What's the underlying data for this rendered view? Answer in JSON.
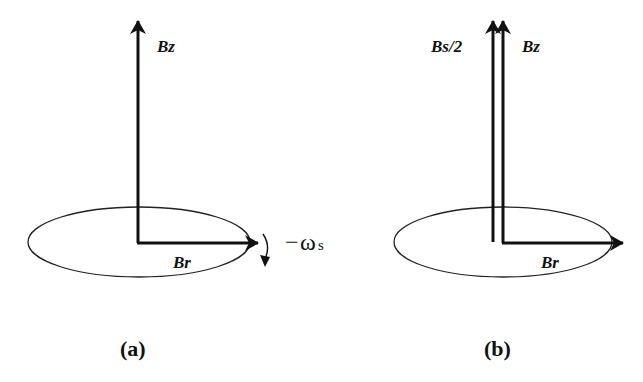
{
  "figure": {
    "panels": [
      {
        "id": "a",
        "caption": "(a)",
        "vectors": [
          {
            "name": "Bz",
            "label": "Bz",
            "direction": "up"
          },
          {
            "name": "Br",
            "label": "Br",
            "direction": "right"
          }
        ],
        "rotation": {
          "label_minus": "−",
          "label_omega": "ω",
          "label_sub": "s",
          "direction": "clockwise"
        }
      },
      {
        "id": "b",
        "caption": "(b)",
        "vectors": [
          {
            "name": "Bs/2",
            "label": "Bs/2",
            "direction": "up"
          },
          {
            "name": "Bz",
            "label": "Bz",
            "direction": "up"
          },
          {
            "name": "Br",
            "label": "Br",
            "direction": "right"
          }
        ]
      }
    ],
    "colors": {
      "stroke": "#111111",
      "background": "#ffffff"
    }
  }
}
